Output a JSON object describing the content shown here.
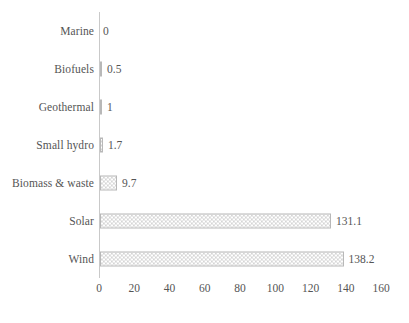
{
  "chart_data": {
    "type": "bar",
    "orientation": "horizontal",
    "title": "",
    "xlabel": "",
    "ylabel": "",
    "xlim": [
      0,
      160
    ],
    "xticks": [
      0,
      20,
      40,
      60,
      80,
      100,
      120,
      140,
      160
    ],
    "grid": false,
    "legend": false,
    "categories": [
      "Marine",
      "Biofuels",
      "Geothermal",
      "Small hydro",
      "Biomass & waste",
      "Solar",
      "Wind"
    ],
    "values": [
      0,
      0.5,
      1,
      1.7,
      9.7,
      131.1,
      138.2
    ],
    "value_labels": [
      "0",
      "0.5",
      "1",
      "1.7",
      "9.7",
      "131.1",
      "138.2"
    ],
    "bars": [
      {
        "category": "Marine",
        "value": 0,
        "label": "0"
      },
      {
        "category": "Biofuels",
        "value": 0.5,
        "label": "0.5"
      },
      {
        "category": "Geothermal",
        "value": 1,
        "label": "1"
      },
      {
        "category": "Small hydro",
        "value": 1.7,
        "label": "1.7"
      },
      {
        "category": "Biomass & waste",
        "value": 9.7,
        "label": "9.7"
      },
      {
        "category": "Solar",
        "value": 131.1,
        "label": "131.1"
      },
      {
        "category": "Wind",
        "value": 138.2,
        "label": "138.2"
      }
    ],
    "colors": {
      "bar_fill": "#d5d5d5",
      "bar_border": "#b8b8b8",
      "axis": "#c9c9c9",
      "text": "#555555",
      "background": "#ffffff"
    }
  }
}
